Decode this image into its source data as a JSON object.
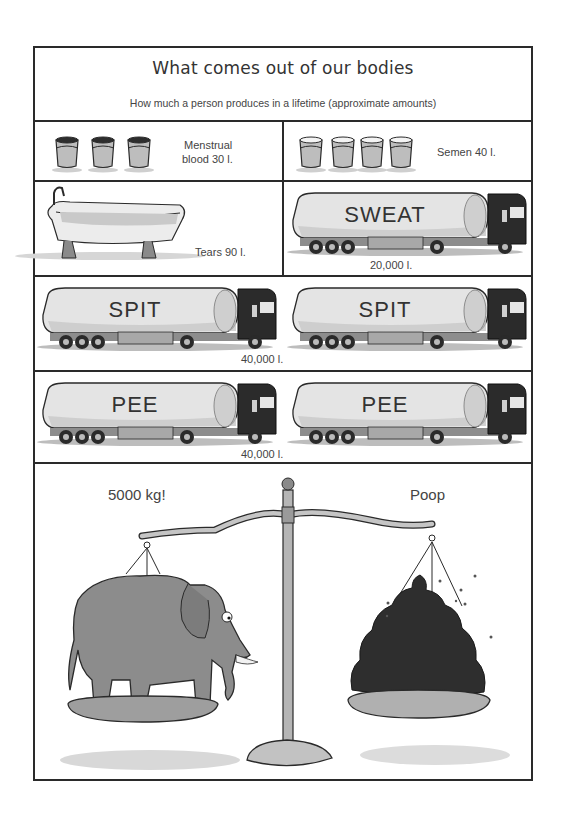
{
  "header": {
    "title": "What comes out of our bodies",
    "subtitle": "How much a person produces in a lifetime (approximate amounts)"
  },
  "panels": {
    "menstrual_blood": {
      "label_line1": "Menstrual",
      "label_line2": "blood 30 l.",
      "icon": "bucket-icon",
      "count": 3,
      "fill": "dark"
    },
    "semen": {
      "label": "Semen 40 l.",
      "icon": "bucket-icon",
      "count": 4,
      "fill": "light"
    },
    "tears": {
      "label": "Tears 90 l.",
      "icon": "bathtub-icon"
    },
    "sweat": {
      "truck_label": "SWEAT",
      "amount": "20,000 l.",
      "trucks": 1
    },
    "spit": {
      "truck_label": "SPIT",
      "amount": "40,000 l.",
      "trucks": 2
    },
    "pee": {
      "truck_label": "PEE",
      "amount": "40,000 l.",
      "trucks": 2
    },
    "scale": {
      "left_label": "5000 kg!",
      "right_label": "Poop",
      "left_item": "elephant",
      "right_item": "poop-pile"
    }
  },
  "colors": {
    "ink": "#2a2a2a",
    "tank": "#e8e8e8",
    "cab": "#2b2b2b",
    "elephant": "#8a8a8a",
    "poop": "#2e2e2e",
    "metal": "#b8b8b8"
  }
}
